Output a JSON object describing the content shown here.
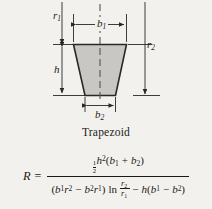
{
  "figure": {
    "caption": "Trapezoid",
    "shape": "trapezoid",
    "fill_color": "#c9c7c4",
    "stroke_color": "#2a2826",
    "background_color": "#f3f1ed",
    "dimensions": [
      {
        "name": "r1-label",
        "label": "r",
        "sub": "1",
        "orientation": "vertical",
        "position": "left-top"
      },
      {
        "name": "r2-label",
        "label": "r",
        "sub": "2",
        "orientation": "vertical",
        "position": "right"
      },
      {
        "name": "b1-label",
        "label": "b",
        "sub": "1",
        "orientation": "horizontal",
        "position": "top"
      },
      {
        "name": "b2-label",
        "label": "b",
        "sub": "2",
        "orientation": "horizontal",
        "position": "bottom"
      },
      {
        "name": "h-label",
        "label": "h",
        "sub": "",
        "orientation": "vertical",
        "position": "left"
      }
    ]
  },
  "formula": {
    "lhs": "R",
    "equals": "=",
    "numerator": {
      "half_top": "1",
      "half_bottom": "2",
      "h": "h",
      "h_exp": "2",
      "paren_open": "(",
      "b1": "b",
      "b1_sub": "1",
      "plus": "+",
      "b2": "b",
      "b2_sub": "2",
      "paren_close": ")"
    },
    "denominator": {
      "paren_open": "(",
      "b1": "b",
      "b1_sub": "1",
      "r2": "r",
      "r2_sub": "2",
      "minus1": "−",
      "b2": "b",
      "b2_sub": "2",
      "r1": "r",
      "r1_sub": "1",
      "paren_close": ")",
      "ln": "ln",
      "log_num": "r",
      "log_num_sub": "2",
      "log_den": "r",
      "log_den_sub": "1",
      "minus2": "−",
      "h": "h",
      "paren_open2": "(",
      "b1b": "b",
      "b1b_sub": "1",
      "minus3": "−",
      "b2b": "b",
      "b2b_sub": "2",
      "paren_close2": ")"
    },
    "plain_text": "R = (1/2)h^2(b1 + b2) / [(b1 r2 - b2 r1) ln(r2/r1) - h(b1 - b2)]"
  }
}
